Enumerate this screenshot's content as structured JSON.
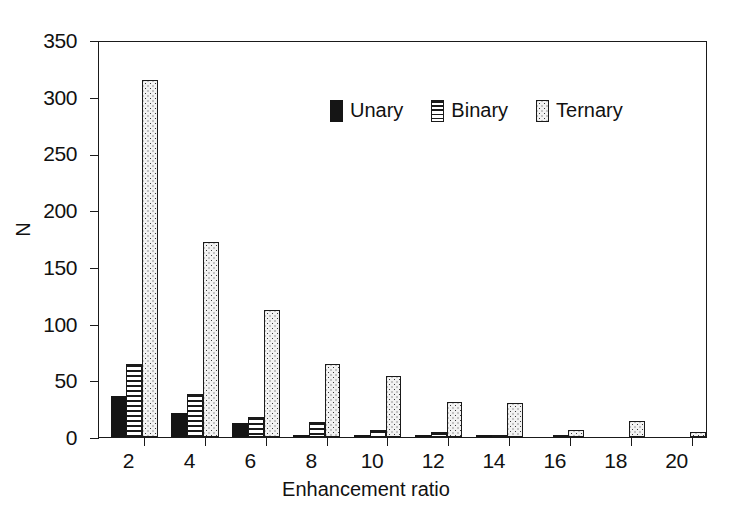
{
  "chart_data": {
    "type": "bar",
    "title": "",
    "xlabel": "Enhancement ratio",
    "ylabel": "N",
    "categories": [
      2,
      4,
      6,
      8,
      10,
      12,
      14,
      16,
      18,
      20
    ],
    "xlim": [
      1,
      21
    ],
    "ylim": [
      0,
      350
    ],
    "ytick_labels": [
      "0",
      "50",
      "100",
      "150",
      "200",
      "250",
      "300",
      "350"
    ],
    "ytick_values": [
      0,
      50,
      100,
      150,
      200,
      250,
      300,
      350
    ],
    "xtick_labels": [
      "2",
      "4",
      "6",
      "8",
      "10",
      "12",
      "14",
      "16",
      "18",
      "20"
    ],
    "grid": false,
    "legend_position": "upper center",
    "series": [
      {
        "name": "Unary",
        "fill": "solid-black",
        "values": [
          36,
          21,
          12,
          1,
          1,
          1,
          1,
          0,
          0,
          0
        ]
      },
      {
        "name": "Binary",
        "fill": "horizontal-lines",
        "values": [
          64,
          38,
          18,
          13,
          6,
          4,
          1,
          1,
          0,
          0
        ]
      },
      {
        "name": "Ternary",
        "fill": "dotted",
        "values": [
          315,
          172,
          112,
          64,
          54,
          31,
          30,
          6,
          14,
          4
        ]
      }
    ]
  },
  "legend": {
    "items": [
      {
        "label": "Unary",
        "swatch": "solid-black-swatch"
      },
      {
        "label": "Binary",
        "swatch": "horizontal-lines-swatch"
      },
      {
        "label": "Ternary",
        "swatch": "dotted-swatch"
      }
    ]
  },
  "colors": {
    "axis": "#1a1a1a",
    "unary": "#151515",
    "binary_line": "#1a1a1a",
    "ternary_fill": "#f2f2f2",
    "ternary_dot": "#3a3a3a",
    "background": "#ffffff"
  }
}
